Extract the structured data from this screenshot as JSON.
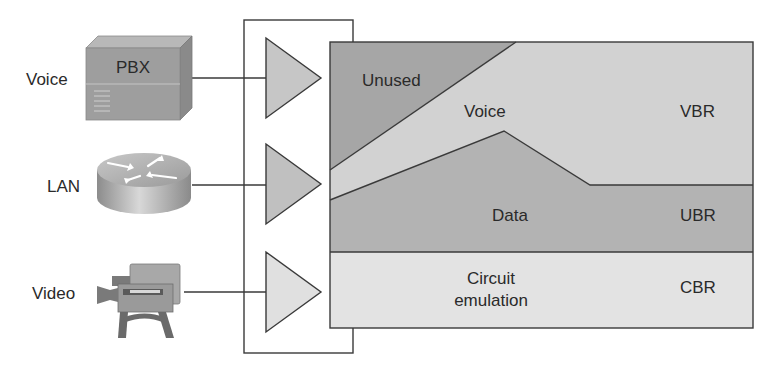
{
  "sources": [
    {
      "label": "Voice",
      "device": "PBX",
      "device_label": "PBX"
    },
    {
      "label": "LAN",
      "device": "router"
    },
    {
      "label": "Video",
      "device": "video-camera"
    }
  ],
  "regions": {
    "unused": {
      "label": "Unused",
      "color": "#a8a8a8"
    },
    "voice": {
      "label": "Voice",
      "color": "#d4d4d4"
    },
    "data": {
      "label": "Data",
      "color": "#b4b4b4"
    },
    "circuit": {
      "label_line1": "Circuit",
      "label_line2": "emulation",
      "color": "#e4e4e4"
    }
  },
  "service_classes": {
    "vbr": "VBR",
    "ubr": "UBR",
    "cbr": "CBR"
  },
  "colors": {
    "line": "#3a3a3a",
    "triangle_fill": "#c8c8c8",
    "triangle_fill_light": "#dedede",
    "device_fill": "#9e9e9e",
    "text": "#2a2a2a"
  }
}
